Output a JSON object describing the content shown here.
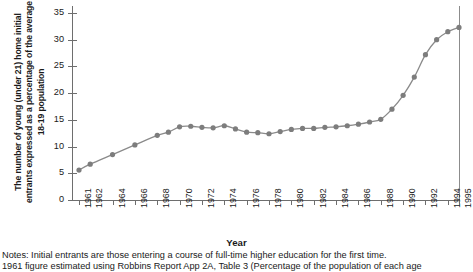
{
  "chart_data": {
    "type": "line",
    "title": "",
    "subtitle": "",
    "xlabel": "Year",
    "ylabel": "The number of young (under 21) home initial entrants expressed as a percentage of the average 18-19 population",
    "ylim": [
      0,
      35
    ],
    "ytick_values": [
      0,
      5,
      10,
      15,
      20,
      25,
      30,
      35
    ],
    "ytick_labels": [
      "0",
      "5",
      "10",
      "15",
      "20",
      "25",
      "30",
      "35"
    ],
    "xlim": [
      1961,
      1995
    ],
    "xtick_labels": [
      "1961",
      "1962",
      "1964",
      "1966",
      "1968",
      "1970",
      "1972",
      "1974",
      "1976",
      "1978",
      "1980",
      "1982",
      "1984",
      "1986",
      "1988",
      "1990",
      "1992",
      "1994",
      "1995"
    ],
    "xtick_values": [
      1961,
      1962,
      1964,
      1966,
      1968,
      1970,
      1972,
      1974,
      1976,
      1978,
      1980,
      1982,
      1984,
      1986,
      1988,
      1990,
      1992,
      1994,
      1995
    ],
    "grid": false,
    "legend": false,
    "legend_position": "none",
    "marker": "circle",
    "line_color": "#8a8a8a",
    "marker_color": "#7d7d7d",
    "axis_color": "#6e6e6e",
    "x": [
      1961,
      1962,
      1964,
      1966,
      1968,
      1969,
      1970,
      1971,
      1972,
      1973,
      1974,
      1975,
      1976,
      1977,
      1978,
      1979,
      1980,
      1981,
      1982,
      1983,
      1984,
      1985,
      1986,
      1987,
      1988,
      1989,
      1990,
      1991,
      1992,
      1993,
      1994,
      1995
    ],
    "values": [
      5.6,
      6.7,
      8.5,
      10.3,
      12.1,
      12.7,
      13.7,
      13.8,
      13.6,
      13.5,
      13.9,
      13.3,
      12.7,
      12.6,
      12.4,
      12.8,
      13.2,
      13.4,
      13.4,
      13.6,
      13.7,
      13.9,
      14.2,
      14.6,
      15.1,
      17.0,
      19.6,
      23.0,
      27.2,
      30.0,
      31.5,
      32.3
    ],
    "series": [
      {
        "name": "Young home initial entrants (% of average 18-19 population)",
        "values": [
          5.6,
          6.7,
          8.5,
          10.3,
          12.1,
          12.7,
          13.7,
          13.8,
          13.6,
          13.5,
          13.9,
          13.3,
          12.7,
          12.6,
          12.4,
          12.8,
          13.2,
          13.4,
          13.4,
          13.6,
          13.7,
          13.9,
          14.2,
          14.6,
          15.1,
          17.0,
          19.6,
          23.0,
          27.2,
          30.0,
          31.5,
          32.3
        ]
      }
    ]
  },
  "notes": {
    "line1": "Notes: Initial entrants are those entering a course of full-time higher education for the first time.",
    "line2": "1961 figure estimated using Robbins Report App 2A, Table 3 (Percentage of the population of each age"
  }
}
